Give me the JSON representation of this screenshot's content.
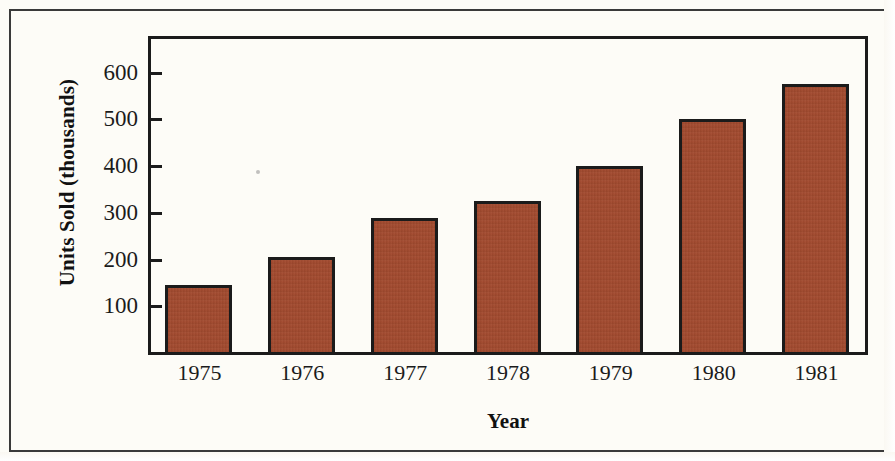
{
  "chart_data": {
    "type": "bar",
    "title": "",
    "xlabel": "Year",
    "ylabel": "Units Sold (thousands)",
    "categories": [
      "1975",
      "1976",
      "1977",
      "1978",
      "1979",
      "1980",
      "1981"
    ],
    "values": [
      145,
      205,
      288,
      325,
      400,
      500,
      575
    ],
    "series": [
      {
        "name": "Units Sold",
        "values": [
          145,
          205,
          288,
          325,
          400,
          500,
          575
        ]
      }
    ],
    "ylim": [
      0,
      640
    ],
    "y_ticks": [
      100,
      200,
      300,
      400,
      500,
      600
    ],
    "y_tick_labels": [
      "100",
      "200",
      "300",
      "400",
      "500",
      "600"
    ],
    "grid": false,
    "legend": false,
    "bar_color": "#a34a2e",
    "bar_edge_color": "#1b1b1b",
    "axis_color": "#1b1b1b",
    "background_color": "#fdfcf7"
  },
  "figure": {
    "frame_color": "#3a3a3a"
  }
}
